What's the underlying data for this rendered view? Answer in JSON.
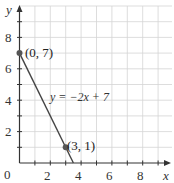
{
  "chart_data": {
    "type": "line",
    "title": "",
    "xlabel": "x",
    "ylabel": "y",
    "xlim": [
      0,
      10
    ],
    "ylim": [
      0,
      10
    ],
    "grid": true,
    "x_ticks": [
      2,
      4,
      6,
      8
    ],
    "y_ticks": [
      2,
      4,
      6,
      8
    ],
    "origin_label": "0",
    "series": [
      {
        "name": "y = -2x + 7",
        "equation": "y = -2x + 7",
        "x": [
          0,
          3.5
        ],
        "y": [
          7,
          0
        ]
      }
    ],
    "points": [
      {
        "x": 0,
        "y": 7,
        "label": "(0, 7)"
      },
      {
        "x": 3,
        "y": 1,
        "label": "(3, 1)"
      }
    ],
    "annotations": [
      {
        "text": "y = -2x + 7",
        "x": 5,
        "y": 4.2
      }
    ]
  },
  "labels": {
    "x_axis": "x",
    "y_axis": "y",
    "origin": "0",
    "x_ticks": [
      "2",
      "4",
      "6",
      "8"
    ],
    "y_ticks": [
      "2",
      "4",
      "6",
      "8"
    ],
    "point_a": "(0, 7)",
    "point_b": "(3, 1)",
    "equation": "y = −2x + 7"
  },
  "colors": {
    "grid": "#d4d4d4",
    "axis": "#333333",
    "line": "#444444",
    "point": "#555555"
  }
}
